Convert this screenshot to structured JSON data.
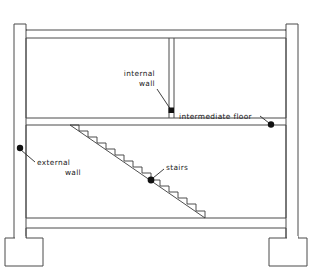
{
  "diagram": {
    "type": "architectural-section",
    "colors": {
      "line": "#4a4a4a",
      "stair_line": "#3a3a3a",
      "leader": "#2a2a2a",
      "marker": "#111111",
      "background": "#ffffff",
      "text": "#1a1a1a"
    },
    "annotations": [
      {
        "id": "internal-wall",
        "line1": "internal",
        "line2": "wall",
        "marker": "square",
        "marker_x": 172,
        "marker_y": 111,
        "text_x": 155,
        "text_y": 83,
        "text_anchor": "end",
        "leader": "M 157 89 L 171 110"
      },
      {
        "id": "intermediate-floor",
        "line1": "intermediate  floor",
        "line2": "",
        "marker": "round",
        "marker_x": 270,
        "marker_y": 125,
        "text_x": 179,
        "text_y": 120,
        "text_anchor": "start",
        "leader": "M 261 117 L 269 124"
      },
      {
        "id": "external-wall",
        "line1": "external",
        "line2": "wall",
        "marker": "round",
        "marker_x": 20,
        "marker_y": 148,
        "text_x": 38,
        "text_y": 160,
        "text_anchor": "start",
        "leader": "M 21 149 L 35 161"
      },
      {
        "id": "stairs",
        "line1": "stairs",
        "line2": "",
        "marker": "round",
        "marker_x": 151,
        "marker_y": 180,
        "text_x": 165,
        "text_y": 172,
        "text_anchor": "start",
        "leader": "M 152 179 L 164 169"
      }
    ],
    "geometry": {
      "outer_left_wall": "M 14 23 L 14 243 L 25 243 L 25 30 L 26 30 L 26 243 L 26 243",
      "roof_slab_y_top": 30,
      "roof_slab_y_bottom": 38,
      "intermediate_floor_y_top": 118,
      "intermediate_floor_y_bottom": 125,
      "ground_slab_y_top": 218,
      "ground_slab_y_bottom": 228,
      "internal_wall_x": 172,
      "stair_steps": 15,
      "stair_top_x": 70,
      "stair_top_y": 125,
      "stair_bottom_x": 203,
      "stair_bottom_y": 218
    }
  }
}
